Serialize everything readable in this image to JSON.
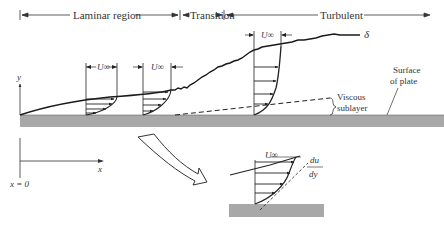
{
  "regions": {
    "laminar": "Laminar region",
    "transition": "Transition",
    "turbulent": "Turbulent"
  },
  "labels": {
    "delta": "δ",
    "u_inf": "U∞",
    "u_inf_1": "U",
    "u_inf_sub": "∞",
    "surface_line1": "Surface",
    "surface_line2": "of plate",
    "viscous_line1": "Viscous",
    "viscous_line2": "sublayer",
    "y_axis": "y",
    "x_axis": "x",
    "origin": "x = 0",
    "du": "du",
    "dy": "dy"
  },
  "colors": {
    "plate": "#a8a8a8",
    "ink": "#222222",
    "text": "#333333"
  }
}
